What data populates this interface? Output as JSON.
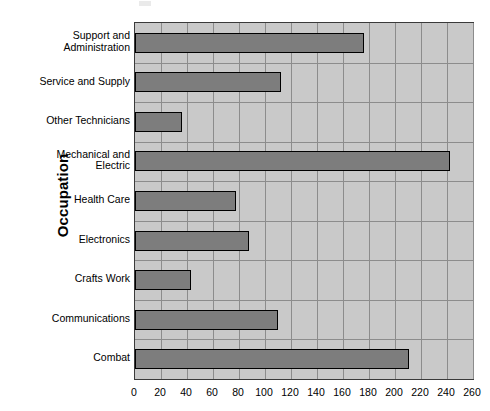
{
  "chart_data": {
    "type": "bar",
    "orientation": "horizontal",
    "title": "",
    "xlabel": "",
    "ylabel": "Occupation",
    "xlim": [
      0,
      260
    ],
    "ylim": null,
    "grid": true,
    "legend": null,
    "x_ticks": [
      0,
      20,
      40,
      60,
      80,
      100,
      120,
      140,
      160,
      180,
      200,
      220,
      240,
      260
    ],
    "categories": [
      "Support and Administration",
      "Service and Supply",
      "Other Technicians",
      "Mechanical and Electric",
      "Health Care",
      "Electronics",
      "Crafts Work",
      "Communications",
      "Combat"
    ],
    "category_lines": [
      [
        "Support and",
        "Administration"
      ],
      [
        "Service and Supply"
      ],
      [
        "Other Technicians"
      ],
      [
        "Mechanical and",
        "Electric"
      ],
      [
        "Health Care"
      ],
      [
        "Electronics"
      ],
      [
        "Crafts Work"
      ],
      [
        "Communications"
      ],
      [
        "Combat"
      ]
    ],
    "values": [
      176,
      112,
      36,
      242,
      78,
      88,
      43,
      110,
      211
    ],
    "colors": {
      "bar_fill": "#7d7d7d",
      "bar_border": "#000000",
      "plot_background": "#c9c9c9",
      "gridline": "#8c8c8c",
      "axis_border": "#3a3a3a",
      "page_background": "#ffffff",
      "text": "#000000"
    }
  }
}
